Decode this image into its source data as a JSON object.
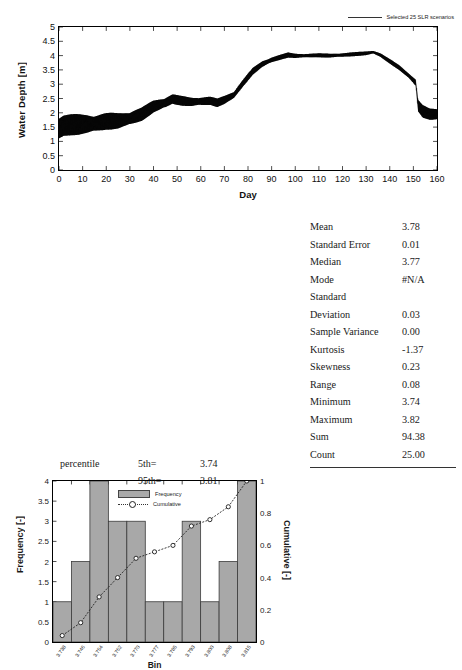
{
  "timeseries": {
    "ylabel": "Water Depth [m]",
    "xlabel": "Day",
    "legend_label": "Selected 25 SLR scenarios",
    "yticks": [
      "0",
      "0.5",
      "1",
      "1.5",
      "2",
      "2.5",
      "3",
      "3.5",
      "4",
      "4.5",
      "5"
    ],
    "xticks": [
      "0",
      "10",
      "20",
      "30",
      "40",
      "50",
      "60",
      "70",
      "80",
      "90",
      "100",
      "110",
      "120",
      "130",
      "140",
      "150",
      "160"
    ]
  },
  "histogram": {
    "ylabel_left": "Frequency [-]",
    "ylabel_right": "Cumulative [-]",
    "xlabel": "Bin",
    "legend_frequency": "Frequency",
    "legend_cumulative": "Cumulative",
    "yticks_left": [
      "0",
      "0.5",
      "1",
      "1.5",
      "2",
      "2.5",
      "3",
      "3.5",
      "4"
    ],
    "yticks_right": [
      "0",
      "0.2",
      "0.4",
      "0.6",
      "0.8",
      "1"
    ]
  },
  "percentile": {
    "label": "percentile",
    "rows": [
      {
        "key": "5th=",
        "value": "3.74"
      },
      {
        "key": "95th=",
        "value": "3.81"
      }
    ]
  },
  "stats": {
    "rows": [
      {
        "name": "Mean",
        "value": "3.78"
      },
      {
        "name": "Standard Error",
        "value": "0.01"
      },
      {
        "name": "Median",
        "value": "3.77"
      },
      {
        "name": "Mode",
        "value": "#N/A"
      },
      {
        "name": "Standard",
        "value": ""
      },
      {
        "name": "Deviation",
        "value": "0.03"
      },
      {
        "name": "Sample Variance",
        "value": "0.00"
      },
      {
        "name": "Kurtosis",
        "value": "-1.37"
      },
      {
        "name": "Skewness",
        "value": "0.23"
      },
      {
        "name": "Range",
        "value": "0.08"
      },
      {
        "name": "Minimum",
        "value": "3.74"
      },
      {
        "name": "Maximum",
        "value": "3.82"
      },
      {
        "name": "Sum",
        "value": "94.38"
      },
      {
        "name": "Count",
        "value": "25.00"
      }
    ]
  },
  "chart_data": [
    {
      "type": "line",
      "title": "",
      "xlabel": "Day",
      "ylabel": "Water Depth [m]",
      "xlim": [
        0,
        160
      ],
      "ylim": [
        0,
        5
      ],
      "grid": false,
      "legend_position": "top-right",
      "series": [
        {
          "name": "Selected 25 SLR scenarios",
          "description": "Dense tidal band (25 overlaid sea-level-rise scenarios); values give the band mid-line with tidal half-amplitude.",
          "x": [
            0,
            2,
            5,
            10,
            15,
            20,
            25,
            30,
            35,
            40,
            45,
            48,
            52,
            56,
            60,
            64,
            67,
            70,
            74,
            78,
            82,
            86,
            90,
            94,
            97,
            100,
            105,
            110,
            115,
            120,
            125,
            130,
            133,
            136,
            140,
            144,
            148,
            151,
            152,
            154,
            157,
            160
          ],
          "mid": [
            1.45,
            1.55,
            1.58,
            1.6,
            1.62,
            1.7,
            1.72,
            1.8,
            1.95,
            2.22,
            2.35,
            2.48,
            2.42,
            2.38,
            2.4,
            2.42,
            2.35,
            2.45,
            2.62,
            3.05,
            3.45,
            3.7,
            3.85,
            3.95,
            4.02,
            3.99,
            4.0,
            4.01,
            4.0,
            4.02,
            4.05,
            4.08,
            4.12,
            4.02,
            3.8,
            3.58,
            3.3,
            3.05,
            2.25,
            2.05,
            1.95,
            1.95
          ],
          "half_amp": [
            0.48,
            0.42,
            0.38,
            0.35,
            0.33,
            0.3,
            0.28,
            0.26,
            0.24,
            0.22,
            0.2,
            0.18,
            0.17,
            0.16,
            0.16,
            0.15,
            0.15,
            0.15,
            0.14,
            0.13,
            0.12,
            0.11,
            0.1,
            0.09,
            0.09,
            0.08,
            0.07,
            0.07,
            0.07,
            0.07,
            0.07,
            0.07,
            0.06,
            0.07,
            0.08,
            0.09,
            0.1,
            0.12,
            0.22,
            0.22,
            0.2,
            0.2
          ]
        }
      ]
    },
    {
      "type": "bar",
      "title": "",
      "xlabel": "Bin",
      "ylabel": "Frequency [-]",
      "ylabel_secondary": "Cumulative [-]",
      "ylim": [
        0,
        4
      ],
      "ylim_secondary": [
        0,
        1
      ],
      "grid": false,
      "legend_position": "top-center",
      "categories": [
        "3.738",
        "3.746",
        "3.754",
        "3.762",
        "3.770",
        "3.777",
        "3.785",
        "3.793",
        "3.800",
        "3.808",
        "3.815"
      ],
      "series": [
        {
          "name": "Frequency",
          "values": [
            1,
            2,
            4,
            3,
            3,
            1,
            1,
            3,
            1,
            2,
            4
          ]
        },
        {
          "name": "Cumulative",
          "values": [
            0.04,
            0.12,
            0.28,
            0.4,
            0.52,
            0.56,
            0.6,
            0.72,
            0.76,
            0.84,
            1.0
          ]
        }
      ]
    }
  ]
}
